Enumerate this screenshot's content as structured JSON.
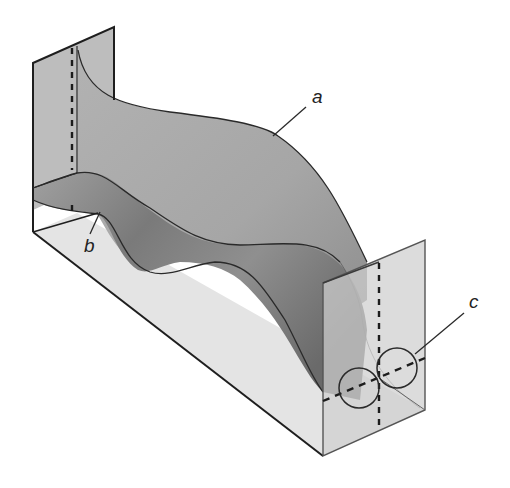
{
  "diagram": {
    "type": "3d-channel-surface-illustration",
    "labels": {
      "a": "a",
      "b": "b",
      "c": "c"
    },
    "colors": {
      "background": "#ffffff",
      "back_panel": "#b9b9b9",
      "surface_a": "#a9a9a9",
      "surface_a_dark": "#8a8a8a",
      "floor_wave_light": "#9c9c9c",
      "floor_wave_dark": "#6e6e6e",
      "floor": "#e3e3e3",
      "front_panel": "#c8c8c8",
      "outline": "#2a2a2a",
      "dashed": "#1c1c1c"
    },
    "components": [
      {
        "id": "left-end-panel",
        "description": "vertical end panel with dashed center line"
      },
      {
        "id": "surface-a",
        "description": "large curved S-shaped sheet, labeled a"
      },
      {
        "id": "floor-wave-b",
        "description": "wavy band along the floor, labeled b"
      },
      {
        "id": "base-floor",
        "description": "flat light floor of the channel"
      },
      {
        "id": "right-end-panel",
        "description": "translucent front end panel with dashed cross lines"
      },
      {
        "id": "circles-c",
        "description": "two tangent circles on the right panel, labeled c"
      }
    ]
  }
}
